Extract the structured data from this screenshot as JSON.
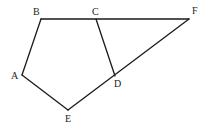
{
  "diagram": {
    "type": "geometry",
    "points": {
      "A": {
        "x": 22,
        "y": 75,
        "label": "A",
        "lx": 11,
        "ly": 79
      },
      "B": {
        "x": 41,
        "y": 19,
        "label": "B",
        "lx": 33,
        "ly": 15
      },
      "C": {
        "x": 96,
        "y": 19,
        "label": "C",
        "lx": 92,
        "ly": 15
      },
      "D": {
        "x": 115,
        "y": 76,
        "label": "D",
        "lx": 114,
        "ly": 87
      },
      "E": {
        "x": 68,
        "y": 110,
        "label": "E",
        "lx": 65,
        "ly": 122
      },
      "F": {
        "x": 189,
        "y": 19,
        "label": "F",
        "lx": 192,
        "ly": 14
      }
    },
    "segments": [
      [
        "A",
        "B"
      ],
      [
        "B",
        "F"
      ],
      [
        "C",
        "D"
      ],
      [
        "A",
        "E"
      ],
      [
        "E",
        "F"
      ]
    ]
  }
}
